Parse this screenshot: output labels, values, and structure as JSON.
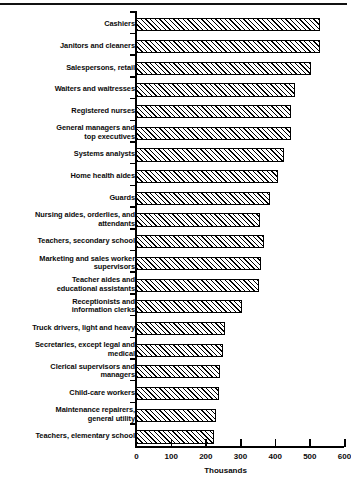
{
  "chart_data": {
    "type": "bar",
    "orientation": "horizontal",
    "title": "",
    "subtitle": "",
    "xlabel": "Thousands",
    "ylabel": "",
    "xlim": [
      0,
      600
    ],
    "xticks": [
      0,
      100,
      200,
      300,
      400,
      500,
      600
    ],
    "xtick_labels": [
      "0",
      "100",
      "200",
      "300",
      "400",
      "500",
      "600"
    ],
    "grid": false,
    "legend": false,
    "units": "Thousands",
    "bar_style": {
      "fill": "hatched-diagonal",
      "edge_color": "#000000",
      "face_color": "#ffffff"
    },
    "categories": [
      "Cashiers",
      "Janitors and cleaners",
      "Salespersons, retail",
      "Waiters and waitresses",
      "Registered nurses",
      "General managers and\ntop executives",
      "Systems analysts",
      "Home health aides",
      "Guards",
      "Nursing aides, orderlies, and\nattendants",
      "Teachers, secondary school",
      "Marketing and sales worker\nsupervisors",
      "Teacher aides and\neducational assistants",
      "Receptionists and\ninformation clerks",
      "Truck drivers, light and heavy",
      "Secretaries, except legal and\nmedical",
      "Clerical supervisors and\nmanagers",
      "Child-care workers",
      "Maintenance repairers,\ngeneral utility",
      "Teachers, elementary school"
    ],
    "values": [
      532,
      530,
      505,
      460,
      447,
      446,
      427,
      411,
      387,
      358,
      370,
      362,
      354,
      305,
      256,
      252,
      242,
      240,
      230,
      225
    ]
  }
}
